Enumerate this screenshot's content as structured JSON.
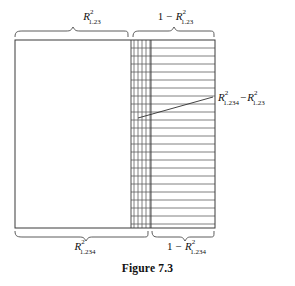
{
  "figure": {
    "caption": "Figure 7.3",
    "labels": {
      "top_left": {
        "symbol": "R",
        "superscript": "2",
        "subscript": "1.23",
        "prefix": "",
        "text": "R²₁.₂₃"
      },
      "top_right": {
        "symbol": "R",
        "superscript": "2",
        "subscript": "1.23",
        "prefix": "1 − ",
        "text": "1 − R²₁.₂₃"
      },
      "bottom_left": {
        "symbol": "R",
        "superscript": "2",
        "subscript": "1.234",
        "prefix": "",
        "text": "R²₁.₂₃₄"
      },
      "bottom_right": {
        "symbol": "R",
        "superscript": "2",
        "subscript": "1.234",
        "prefix": "1 − ",
        "text": "1 − R²₁.₂₃₄"
      },
      "callout": {
        "first_symbol": "R",
        "first_superscript": "2",
        "first_subscript": "1.234",
        "operator": "−",
        "second_symbol": "R",
        "second_superscript": "2",
        "second_subscript": "1.23",
        "text": "R²₁.₂₃₄ − R²₁.₂₃"
      }
    },
    "colors": {
      "line": "#3a3a3a",
      "hatch": "#555555",
      "brace": "#4a4a4a",
      "text": "#111111",
      "background": "#ffffff"
    },
    "geometry": {
      "rect_left": 15,
      "rect_top": 40,
      "rect_right": 215,
      "rect_bottom": 228,
      "split_top": 131,
      "split_bottom": 151,
      "horizontal_hatch_count": 23,
      "vertical_hatch_count": 5,
      "leader_start_x": 138,
      "leader_start_y": 118,
      "leader_end_x": 213,
      "leader_end_y": 97
    }
  }
}
